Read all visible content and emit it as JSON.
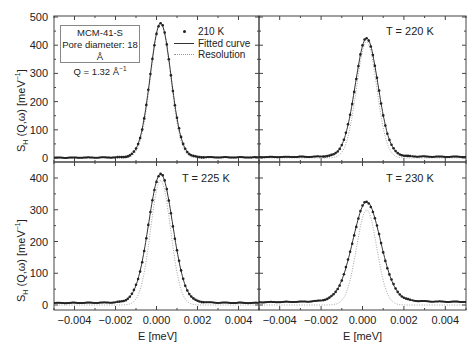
{
  "figure": {
    "info_box": {
      "line1": "MCM-41-S",
      "line2": "Pore diameter: 18 Å",
      "line3_prefix": "Q = 1.32 Å",
      "line3_sup": "−1"
    },
    "legend": {
      "points": "210 K",
      "fitted": "Fitted curve",
      "resolution": "Resolution"
    },
    "panels": [
      {
        "id": "top-left",
        "temp_label": "",
        "legend_temp": "210 K"
      },
      {
        "id": "top-right",
        "temp_label": "T = 220 K"
      },
      {
        "id": "bottom-left",
        "temp_label": "T = 225 K"
      },
      {
        "id": "bottom-right",
        "temp_label": "T = 230 K"
      }
    ],
    "ylabel": {
      "main": "S",
      "sub": "H",
      "rest": " (Q,ω) [meV",
      "sup": "−1",
      "end": "]"
    },
    "xlabel": "E [meV]",
    "top_yticks": [
      "0",
      "100",
      "200",
      "300",
      "400",
      "500"
    ],
    "bottom_yticks": [
      "0",
      "100",
      "200",
      "300",
      "400"
    ],
    "xticks": [
      "−0.004",
      "−0.002",
      "0.000",
      "0.002",
      "0.004"
    ]
  },
  "chart_data": [
    {
      "type": "line",
      "title": "210 K (MCM-41-S, Pore diameter 18 Å, Q = 1.32 Å⁻¹)",
      "xlabel": "E [meV]",
      "ylabel": "S_H (Q,ω) [meV⁻¹]",
      "xlim": [
        -0.005,
        0.005
      ],
      "ylim": [
        -15,
        500
      ],
      "peak_center": 0.0002,
      "peak_height": 478,
      "fwhm": 0.0012,
      "baseline": 2,
      "series": [
        {
          "name": "210 K",
          "style": "points"
        },
        {
          "name": "Fitted curve",
          "style": "solid"
        },
        {
          "name": "Resolution",
          "style": "dotted"
        }
      ],
      "x": [
        -0.005,
        -0.004,
        -0.003,
        -0.002,
        -0.001,
        -0.0005,
        0.0,
        0.0002,
        0.0005,
        0.001,
        0.0015,
        0.002,
        0.003,
        0.004,
        0.005
      ],
      "values": [
        1,
        2,
        3,
        6,
        60,
        230,
        430,
        478,
        420,
        160,
        35,
        10,
        4,
        3,
        2
      ]
    },
    {
      "type": "line",
      "title": "T = 220 K",
      "xlim": [
        -0.005,
        0.005
      ],
      "ylim": [
        -15,
        500
      ],
      "peak_center": 0.0002,
      "peak_height": 425,
      "fwhm": 0.0013,
      "x": [
        -0.005,
        -0.004,
        -0.003,
        -0.002,
        -0.001,
        -0.0005,
        0.0,
        0.0002,
        0.0005,
        0.001,
        0.0015,
        0.002,
        0.003,
        0.004,
        0.005
      ],
      "values": [
        3,
        5,
        8,
        15,
        70,
        230,
        390,
        425,
        370,
        170,
        50,
        22,
        10,
        6,
        4
      ]
    },
    {
      "type": "line",
      "title": "T = 225 K",
      "xlim": [
        -0.005,
        0.005
      ],
      "ylim": [
        -15,
        420
      ],
      "peak_center": 0.0002,
      "peak_height": 413,
      "fwhm": 0.0014,
      "x": [
        -0.005,
        -0.004,
        -0.003,
        -0.002,
        -0.001,
        -0.0005,
        0.0,
        0.0002,
        0.0005,
        0.001,
        0.0015,
        0.002,
        0.003,
        0.004,
        0.005
      ],
      "values": [
        6,
        9,
        14,
        25,
        80,
        230,
        380,
        413,
        370,
        180,
        60,
        28,
        14,
        9,
        6
      ]
    },
    {
      "type": "line",
      "title": "T = 230 K",
      "xlim": [
        -0.005,
        0.005
      ],
      "ylim": [
        -15,
        420
      ],
      "peak_center": 0.0002,
      "peak_height": 325,
      "fwhm": 0.0016,
      "x": [
        -0.005,
        -0.004,
        -0.003,
        -0.002,
        -0.001,
        -0.0005,
        0.0,
        0.0002,
        0.0005,
        0.001,
        0.0015,
        0.002,
        0.003,
        0.004,
        0.005
      ],
      "values": [
        8,
        15,
        22,
        35,
        90,
        200,
        300,
        325,
        290,
        160,
        70,
        40,
        22,
        14,
        9
      ]
    }
  ]
}
